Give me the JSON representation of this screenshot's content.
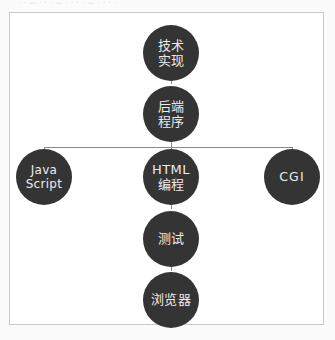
{
  "figure": {
    "top_clipped_text": "· · — · · · — · · · · — · · · ·",
    "background_color": "#fbfbfb",
    "frame_color": "#c9c9cd",
    "frame_fill": "#ffffff",
    "node_color": "#343434",
    "node_text_color": "#ececed",
    "connector_color": "#8a8a8f"
  },
  "diagram": {
    "type": "tree",
    "orientation": "top-down",
    "nodes": [
      {
        "id": "tech-implementation",
        "lines": [
          "技术",
          "实现"
        ],
        "script": "cn",
        "cx": 170,
        "cy": 49,
        "r": 28
      },
      {
        "id": "backend-program",
        "lines": [
          "后端",
          "程序"
        ],
        "script": "cn",
        "cx": 170,
        "cy": 110,
        "r": 28
      },
      {
        "id": "javascript",
        "lines": [
          "Java",
          "Script"
        ],
        "script": "en",
        "cx": 43,
        "cy": 173,
        "r": 28
      },
      {
        "id": "html-programming",
        "lines": [
          "HTML",
          "编程"
        ],
        "script": "cn",
        "cx": 170,
        "cy": 173,
        "r": 28
      },
      {
        "id": "cgi",
        "lines": [
          "CGI"
        ],
        "script": "en-single",
        "cx": 291,
        "cy": 173,
        "r": 28
      },
      {
        "id": "testing",
        "lines": [
          "测试"
        ],
        "script": "cn",
        "cx": 170,
        "cy": 235,
        "r": 28
      },
      {
        "id": "browser",
        "lines": [
          "浏览器"
        ],
        "script": "cn",
        "cx": 170,
        "cy": 296,
        "r": 28
      }
    ],
    "edges": [
      {
        "from": "tech-implementation",
        "to": "backend-program"
      },
      {
        "from": "backend-program",
        "to": "javascript"
      },
      {
        "from": "backend-program",
        "to": "html-programming"
      },
      {
        "from": "backend-program",
        "to": "cgi"
      },
      {
        "from": "html-programming",
        "to": "testing"
      },
      {
        "from": "testing",
        "to": "browser"
      }
    ]
  }
}
